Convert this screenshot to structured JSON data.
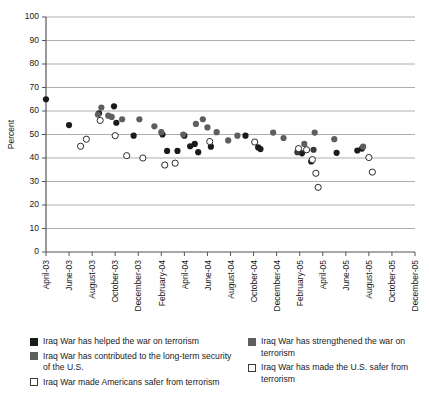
{
  "chart_data": {
    "type": "scatter",
    "title": "",
    "xlabel": "",
    "ylabel": "Percent",
    "ylim": [
      0,
      100
    ],
    "ytick_step": 10,
    "grid": true,
    "legend_position": "bottom",
    "ytick_labels": [
      "0",
      "10",
      "20",
      "30",
      "40",
      "50",
      "60",
      "70",
      "80",
      "90",
      "100"
    ],
    "xtick_labels": [
      "April-03",
      "June-03",
      "August-03",
      "October-03",
      "December-03",
      "February-04",
      "April-04",
      "June-04",
      "August-04",
      "October-04",
      "December-04",
      "February-05",
      "April-05",
      "June-05",
      "August-05",
      "October-05",
      "December-05"
    ],
    "series": [
      {
        "name": "Iraq War has helped the war on terrorism",
        "marker": "filled-circle",
        "color": "#1b1b1b",
        "points": [
          {
            "x": 0.0,
            "y": 65
          },
          {
            "x": 2.0,
            "y": 54
          },
          {
            "x": 4.6,
            "y": 59
          },
          {
            "x": 5.9,
            "y": 62
          },
          {
            "x": 6.1,
            "y": 55
          },
          {
            "x": 7.6,
            "y": 49.5
          },
          {
            "x": 10.1,
            "y": 50
          },
          {
            "x": 10.5,
            "y": 43
          },
          {
            "x": 11.4,
            "y": 43
          },
          {
            "x": 12.0,
            "y": 49.5
          },
          {
            "x": 12.5,
            "y": 45
          },
          {
            "x": 12.9,
            "y": 46
          },
          {
            "x": 13.2,
            "y": 42.5
          },
          {
            "x": 14.3,
            "y": 44.8
          },
          {
            "x": 17.3,
            "y": 49.5
          },
          {
            "x": 18.4,
            "y": 44.5
          },
          {
            "x": 18.6,
            "y": 43.8
          },
          {
            "x": 22.2,
            "y": 42
          },
          {
            "x": 23.0,
            "y": 38.5
          },
          {
            "x": 25.2,
            "y": 42.2
          },
          {
            "x": 27.0,
            "y": 43.2
          },
          {
            "x": 27.4,
            "y": 44
          }
        ]
      },
      {
        "name": "Iraq War has contributed to the long-term security of the U.S.",
        "marker": "filled-circle",
        "color": "#5e5e5e",
        "points": [
          {
            "x": 4.5,
            "y": 58.5
          },
          {
            "x": 4.8,
            "y": 61.5
          },
          {
            "x": 5.4,
            "y": 58
          },
          {
            "x": 5.7,
            "y": 57.5
          },
          {
            "x": 6.6,
            "y": 56.5
          },
          {
            "x": 8.1,
            "y": 56.5
          },
          {
            "x": 9.4,
            "y": 53.5
          },
          {
            "x": 10.0,
            "y": 51
          },
          {
            "x": 11.9,
            "y": 50
          },
          {
            "x": 13.0,
            "y": 54.5
          },
          {
            "x": 13.6,
            "y": 56.5
          },
          {
            "x": 14.0,
            "y": 53
          },
          {
            "x": 14.8,
            "y": 51
          },
          {
            "x": 15.8,
            "y": 47.5
          },
          {
            "x": 16.6,
            "y": 49.5
          },
          {
            "x": 19.7,
            "y": 50.8
          },
          {
            "x": 20.6,
            "y": 48.5
          },
          {
            "x": 22.4,
            "y": 46
          },
          {
            "x": 23.3,
            "y": 50.8
          },
          {
            "x": 25.0,
            "y": 48
          },
          {
            "x": 27.5,
            "y": 44.8
          }
        ]
      },
      {
        "name": "Iraq War has strengthened the war on terrorism",
        "marker": "filled-circle",
        "color": "#3a3a3a",
        "points": [
          {
            "x": 21.8,
            "y": 42.5
          },
          {
            "x": 23.2,
            "y": 43.5
          }
        ]
      },
      {
        "name": "Iraq War made Americans safer from terrorism",
        "marker": "open-circle",
        "color": "#ffffff",
        "points": [
          {
            "x": 3.0,
            "y": 45
          },
          {
            "x": 3.5,
            "y": 48
          },
          {
            "x": 4.7,
            "y": 56
          },
          {
            "x": 6.0,
            "y": 49.5
          },
          {
            "x": 7.0,
            "y": 41
          },
          {
            "x": 8.4,
            "y": 40
          },
          {
            "x": 10.3,
            "y": 37
          },
          {
            "x": 11.2,
            "y": 37.8
          },
          {
            "x": 14.2,
            "y": 47
          },
          {
            "x": 22.6,
            "y": 43.5
          },
          {
            "x": 23.1,
            "y": 39.3
          },
          {
            "x": 23.4,
            "y": 33.5
          },
          {
            "x": 23.6,
            "y": 27.5
          },
          {
            "x": 28.0,
            "y": 40.2
          },
          {
            "x": 28.3,
            "y": 34
          }
        ]
      },
      {
        "name": "Iraq War has made the U.S. safer from terrorism",
        "marker": "open-circle",
        "color": "#ffffff",
        "points": [
          {
            "x": 18.1,
            "y": 46.8
          },
          {
            "x": 21.9,
            "y": 44
          }
        ]
      }
    ]
  },
  "axes": {
    "y_title": "Percent"
  },
  "legend": {
    "columns": [
      {
        "items": [
          {
            "swatch": "black",
            "label": "Iraq War has helped the war on terrorism"
          },
          {
            "swatch": "gray",
            "label": "Iraq War has contributed to the long-term security of the U.S."
          },
          {
            "swatch": "open",
            "label": "Iraq War made Americans safer from terrorism"
          }
        ]
      },
      {
        "items": [
          {
            "swatch": "gray",
            "label": "Iraq War has strengthened the war on terrorism"
          },
          {
            "swatch": "open",
            "label": "Iraq War has made the U.S. safer from terrorism"
          }
        ]
      }
    ]
  }
}
